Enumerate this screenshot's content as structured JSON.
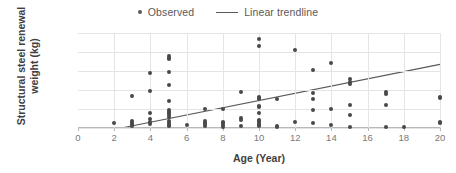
{
  "legend": {
    "position": "top-center",
    "entries": [
      {
        "label": "Observed",
        "marker": "dot",
        "color": "#595959"
      },
      {
        "label": "Linear trendline",
        "marker": "line",
        "color": "#595959"
      }
    ]
  },
  "axes": {
    "x_title": "Age (Year)",
    "y_title": "Structural steel renewal weight (kg)",
    "y_title_line1": "Structural steel",
    "y_title_line2": "renewal weight (kg)"
  },
  "chart_data": {
    "type": "scatter",
    "title": "",
    "xlabel": "Age (Year)",
    "ylabel": "Structural steel renewal weight (kg)",
    "xlim": [
      0,
      20
    ],
    "ylim": [
      0,
      10000
    ],
    "xticks": [
      0,
      2,
      4,
      6,
      8,
      10,
      12,
      14,
      16,
      18,
      20
    ],
    "xticklabels": [
      "0",
      "2",
      "4",
      "6",
      "8",
      "10",
      "12",
      "14",
      "16",
      "18",
      "20"
    ],
    "yticks": [
      0,
      2000,
      4000,
      6000,
      8000,
      10000
    ],
    "yticklabels": [
      "0",
      "2,000",
      "4,000",
      "6,000",
      "8,000",
      "10,000"
    ],
    "grid": true,
    "grid_axis": "both",
    "grid_color": "#e4e4e4",
    "marker_color": "#494949",
    "series": [
      {
        "name": "Observed",
        "type": "scatter",
        "points": [
          [
            2,
            560
          ],
          [
            3,
            3420
          ],
          [
            3,
            700
          ],
          [
            3,
            520
          ],
          [
            3,
            380
          ],
          [
            3,
            180
          ],
          [
            4,
            5780
          ],
          [
            4,
            3900
          ],
          [
            4,
            1560
          ],
          [
            4,
            900
          ],
          [
            4,
            640
          ],
          [
            4,
            430
          ],
          [
            5,
            7540
          ],
          [
            5,
            7380
          ],
          [
            5,
            7280
          ],
          [
            5,
            5880
          ],
          [
            5,
            4560
          ],
          [
            5,
            2880
          ],
          [
            5,
            1880
          ],
          [
            5,
            1720
          ],
          [
            5,
            1560
          ],
          [
            5,
            1380
          ],
          [
            5,
            1180
          ],
          [
            5,
            700
          ],
          [
            5,
            520
          ],
          [
            5,
            340
          ],
          [
            5,
            160
          ],
          [
            6,
            300
          ],
          [
            7,
            1960
          ],
          [
            7,
            740
          ],
          [
            7,
            560
          ],
          [
            7,
            420
          ],
          [
            7,
            200
          ],
          [
            8,
            2020
          ],
          [
            8,
            620
          ],
          [
            8,
            480
          ],
          [
            8,
            300
          ],
          [
            8,
            140
          ],
          [
            9,
            3800
          ],
          [
            9,
            1060
          ],
          [
            9,
            820
          ],
          [
            9,
            180
          ],
          [
            10,
            9340
          ],
          [
            10,
            8580
          ],
          [
            10,
            3280
          ],
          [
            10,
            3140
          ],
          [
            10,
            3020
          ],
          [
            10,
            2280
          ],
          [
            10,
            2180
          ],
          [
            10,
            1540
          ],
          [
            10,
            880
          ],
          [
            10,
            720
          ],
          [
            10,
            580
          ],
          [
            10,
            440
          ],
          [
            10,
            320
          ],
          [
            10,
            180
          ],
          [
            11,
            3080
          ],
          [
            11,
            220
          ],
          [
            11,
            120
          ],
          [
            12,
            8180
          ],
          [
            12,
            580
          ],
          [
            13,
            6120
          ],
          [
            13,
            3640
          ],
          [
            13,
            3040
          ],
          [
            13,
            1940
          ],
          [
            13,
            560
          ],
          [
            14,
            6880
          ],
          [
            14,
            2020
          ],
          [
            14,
            280
          ],
          [
            15,
            5180
          ],
          [
            15,
            4860
          ],
          [
            15,
            4620
          ],
          [
            15,
            2380
          ],
          [
            15,
            1320
          ],
          [
            15,
            120
          ],
          [
            17,
            3780
          ],
          [
            17,
            3620
          ],
          [
            17,
            2420
          ],
          [
            17,
            80
          ],
          [
            18,
            80
          ],
          [
            20,
            3260
          ],
          [
            20,
            3140
          ],
          [
            20,
            600
          ],
          [
            20,
            480
          ]
        ]
      },
      {
        "name": "Linear trendline",
        "type": "line",
        "color": "#595959",
        "x_start": 2.4,
        "y_start": 0,
        "x_end": 20,
        "y_end": 6700
      }
    ]
  }
}
